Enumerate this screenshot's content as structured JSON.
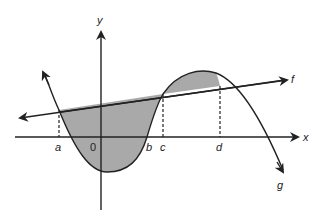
{
  "diagram": {
    "axes": {
      "x_label": "x",
      "y_label": "y",
      "origin_label": "0"
    },
    "functions": [
      {
        "name": "f",
        "label": "f",
        "type": "line"
      },
      {
        "name": "g",
        "label": "g",
        "type": "cubic curve"
      }
    ],
    "points": [
      {
        "label": "a",
        "description": "left intersection of f and g"
      },
      {
        "label": "b",
        "description": "x-intercept of g"
      },
      {
        "label": "c",
        "description": "middle intersection of f and g"
      },
      {
        "label": "d",
        "description": "right intersection of f and g"
      }
    ],
    "shaded_regions": [
      "region between f and g from a to c",
      "region between f and g from c to d"
    ],
    "colors": {
      "stroke": "#222222",
      "shade": "#a9a9a9",
      "background": "#ffffff"
    }
  }
}
